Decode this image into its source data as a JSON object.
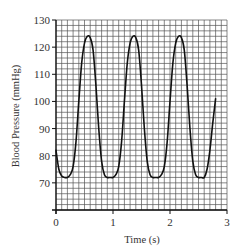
{
  "chart_data": {
    "type": "line",
    "title": "",
    "xlabel": "Time (s)",
    "ylabel": "Blood Pressure (mmHg)",
    "xlim": [
      0,
      3
    ],
    "ylim": [
      60,
      130
    ],
    "x_ticks": [
      "0",
      "1",
      "2",
      "3"
    ],
    "y_ticks": [
      "70",
      "80",
      "90",
      "100",
      "110",
      "120",
      "130"
    ],
    "grid": true,
    "grid_minor_x_step": 0.1,
    "grid_minor_y_step": 2,
    "legend": null,
    "series": [
      {
        "name": "Blood Pressure",
        "x": [
          0.0,
          0.05,
          0.1,
          0.15,
          0.2,
          0.25,
          0.3,
          0.35,
          0.4,
          0.45,
          0.5,
          0.55,
          0.6,
          0.65,
          0.7,
          0.75,
          0.8,
          0.85,
          0.9,
          0.95,
          1.0,
          1.05,
          1.1,
          1.15,
          1.2,
          1.25,
          1.3,
          1.35,
          1.4,
          1.45,
          1.5,
          1.55,
          1.6,
          1.65,
          1.7,
          1.75,
          1.8,
          1.85,
          1.9,
          1.95,
          2.0,
          2.05,
          2.1,
          2.15,
          2.2,
          2.25,
          2.3,
          2.35,
          2.4,
          2.45,
          2.5,
          2.55,
          2.6,
          2.65,
          2.7,
          2.75,
          2.8
        ],
        "values": [
          82,
          75,
          72.5,
          72,
          72,
          73,
          76,
          85,
          100,
          114,
          121.5,
          124,
          123.5,
          119,
          106,
          90,
          78,
          73,
          72,
          72,
          72,
          73,
          76,
          85,
          100,
          114,
          121.5,
          124,
          123.5,
          119,
          106,
          90,
          78,
          73,
          72,
          72,
          72,
          73,
          76,
          85,
          100,
          114,
          121.5,
          124,
          123.5,
          119,
          106,
          90,
          78,
          73,
          72,
          72,
          72,
          75,
          82,
          92,
          101
        ]
      }
    ]
  }
}
